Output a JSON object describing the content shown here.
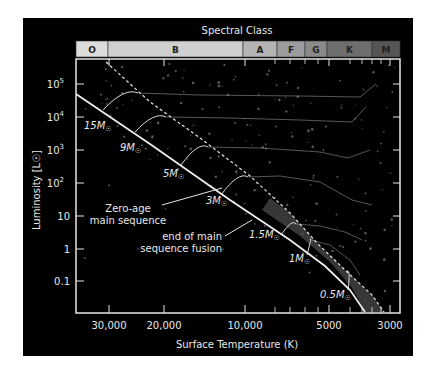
{
  "title": "Spectral Class",
  "spectral_classes": [
    {
      "label": "O",
      "x0": 76,
      "x1": 108,
      "color": "#dcdcdc"
    },
    {
      "label": "B",
      "x0": 108,
      "x1": 243,
      "color": "#cfcfcf"
    },
    {
      "label": "A",
      "x0": 243,
      "x1": 277,
      "color": "#b4b4b4"
    },
    {
      "label": "F",
      "x0": 277,
      "x1": 305,
      "color": "#9c9c9c"
    },
    {
      "label": "G",
      "x0": 305,
      "x1": 327,
      "color": "#8a8a8a"
    },
    {
      "label": "K",
      "x0": 327,
      "x1": 372,
      "color": "#6e6e6e"
    },
    {
      "label": "M",
      "x0": 372,
      "x1": 400,
      "color": "#555555"
    }
  ],
  "axes": {
    "xlabel": "Surface Temperature (K)",
    "ylabel": "Luminosity [L☉]",
    "xticks": [
      {
        "label": "30,000",
        "x": 109
      },
      {
        "label": "20,000",
        "x": 164
      },
      {
        "label": "10,000",
        "x": 245
      },
      {
        "label": "5000",
        "x": 329
      },
      {
        "label": "3000",
        "x": 390
      }
    ],
    "yticks": [
      {
        "base": "10",
        "exp": "5",
        "y": 84
      },
      {
        "base": "10",
        "exp": "4",
        "y": 117
      },
      {
        "base": "10",
        "exp": "3",
        "y": 150
      },
      {
        "base": "10",
        "exp": "2",
        "y": 183
      },
      {
        "base": "10",
        "exp": "",
        "y": 216
      },
      {
        "base": "1",
        "exp": "",
        "y": 249
      },
      {
        "base": "0.1",
        "exp": "",
        "y": 281
      }
    ]
  },
  "annotations": {
    "zams_line1": "Zero-age",
    "zams_line2": "main sequence",
    "end_line1": "end of main",
    "end_line2": "sequence fusion"
  },
  "mass_tracks": [
    {
      "label": "15M",
      "unit": "☉",
      "lx": 84,
      "ly": 129,
      "zams": [
        103,
        110
      ],
      "tams": [
        138,
        93
      ],
      "tail": [
        [
          200,
          95
        ],
        [
          300,
          96
        ],
        [
          360,
          97
        ],
        [
          376,
          84
        ]
      ]
    },
    {
      "label": "9M",
      "unit": "☉",
      "lx": 120,
      "ly": 151,
      "zams": [
        135,
        132
      ],
      "tams": [
        166,
        117
      ],
      "tail": [
        [
          230,
          118
        ],
        [
          300,
          120
        ],
        [
          352,
          122
        ],
        [
          366,
          107
        ]
      ]
    },
    {
      "label": "5M",
      "unit": "☉",
      "lx": 163,
      "ly": 177,
      "zams": [
        181,
        165
      ],
      "tams": [
        208,
        147
      ],
      "tail": [
        [
          260,
          148
        ],
        [
          320,
          152
        ],
        [
          348,
          158
        ],
        [
          370,
          150
        ]
      ]
    },
    {
      "label": "3M",
      "unit": "☉",
      "lx": 206,
      "ly": 204,
      "zams": [
        221,
        195
      ],
      "tams": [
        248,
        177
      ],
      "tail": [
        [
          280,
          176
        ],
        [
          320,
          182
        ],
        [
          352,
          200
        ],
        [
          372,
          205
        ]
      ]
    },
    {
      "label": "1.5M",
      "unit": "☉",
      "lx": 249,
      "ly": 238,
      "zams": [
        281,
        235
      ],
      "tams": [
        296,
        224
      ],
      "tail": [
        [
          320,
          226
        ],
        [
          345,
          232
        ],
        [
          362,
          240
        ]
      ]
    },
    {
      "label": "1M",
      "unit": "☉",
      "lx": 289,
      "ly": 262,
      "zams": [
        307,
        255
      ],
      "tams": [
        310,
        240
      ],
      "tail": [
        [
          330,
          245
        ],
        [
          350,
          260
        ],
        [
          360,
          275
        ]
      ]
    },
    {
      "label": "0.5M",
      "unit": "☉",
      "lx": 320,
      "ly": 298,
      "zams": [
        348,
        290
      ],
      "tams": [
        346,
        272
      ],
      "tail": []
    }
  ],
  "colors": {
    "background": "#000000",
    "line": "#e6e6e6",
    "track": "#9a9a9a",
    "band": "#4a4a4a",
    "star": "#5a5a5a"
  }
}
